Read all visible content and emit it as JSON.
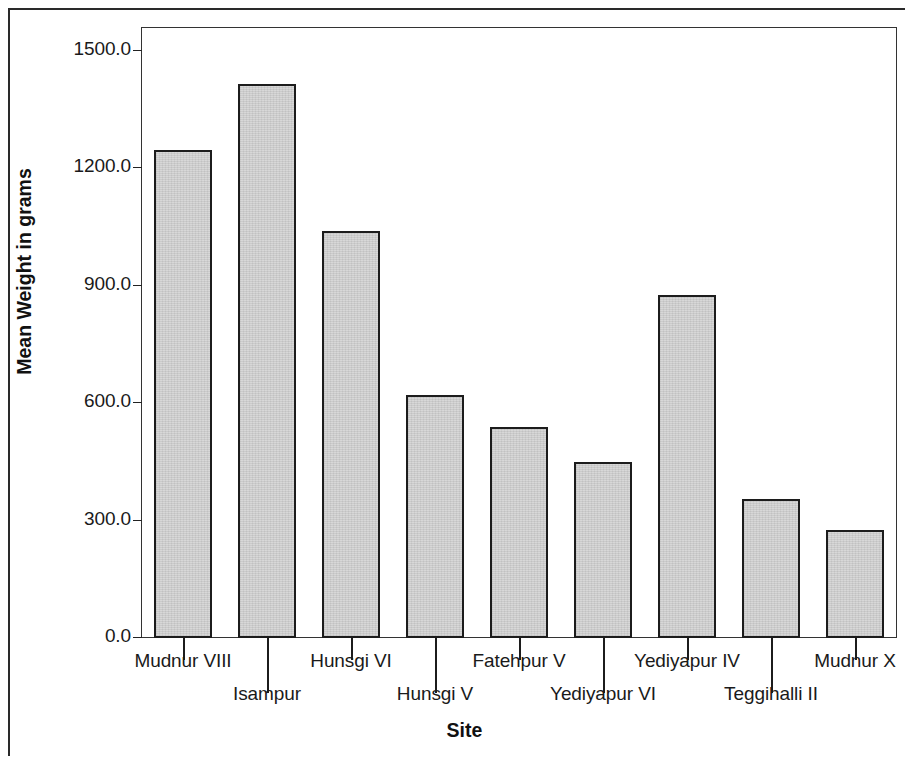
{
  "chart_data": {
    "type": "bar",
    "title": "",
    "xlabel": "Site",
    "ylabel": "Mean Weight in grams",
    "categories": [
      "Mudnur VIII",
      "Isampur",
      "Hunsgi VI",
      "Hunsgi V",
      "Fatehpur V",
      "Yediyapur VI",
      "Yediyapur IV",
      "Teggihalli II",
      "Mudnur X"
    ],
    "values": [
      1245,
      1415,
      1040,
      620,
      538,
      449,
      877,
      354,
      277
    ],
    "ylim": [
      0,
      1560
    ],
    "ytick_values": [
      0,
      300,
      600,
      900,
      1200,
      1500
    ],
    "ytick_labels": [
      "0.0",
      "300.0",
      "600.0",
      "900.0",
      "1200.0",
      "1500.0"
    ],
    "grid": false,
    "legend": false,
    "legend_position": "none",
    "bar_fill_color": "#d3d3d3",
    "bar_edge_color": "#1c1c1c",
    "axis_color": "#333333",
    "label_stagger": [
      "upper",
      "lower",
      "upper",
      "lower",
      "upper",
      "lower",
      "upper",
      "lower",
      "upper"
    ]
  },
  "axes": {
    "y_title": "Mean Weight in grams",
    "x_title": "Site"
  }
}
